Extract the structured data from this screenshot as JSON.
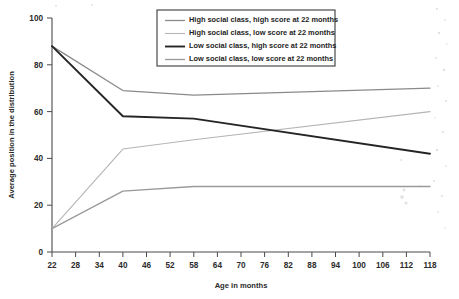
{
  "chart_data": {
    "type": "line",
    "title": "",
    "xlabel": "Age in months",
    "ylabel": "Average position in the distribution",
    "xlim": [
      22,
      118
    ],
    "ylim": [
      0,
      100
    ],
    "xticks": [
      22,
      28,
      34,
      40,
      46,
      52,
      58,
      64,
      70,
      76,
      82,
      88,
      94,
      100,
      106,
      112,
      118
    ],
    "yticks": [
      0,
      20,
      40,
      60,
      80,
      100
    ],
    "grid": false,
    "legend_position": "top-center",
    "x": [
      22,
      40,
      58,
      118
    ],
    "series": [
      {
        "name": "High social class, high score at 22 months",
        "values": [
          88,
          69,
          67,
          70
        ],
        "color": "#8a8a8a",
        "width": 1.3
      },
      {
        "name": "High social class, low score at 22 months",
        "values": [
          10,
          44,
          48,
          60
        ],
        "color": "#b5b5b5",
        "width": 1.1
      },
      {
        "name": "Low social class, high score at 22 months",
        "values": [
          88,
          58,
          57,
          42
        ],
        "color": "#252525",
        "width": 1.9
      },
      {
        "name": "Low social class, low score at 22 months",
        "values": [
          10,
          26,
          28,
          28
        ],
        "color": "#9a9a9a",
        "width": 1.3
      }
    ]
  },
  "axes": {
    "ylabel": "Average position in the distribution",
    "xlabel": "Age in months",
    "ytick_labels": [
      "100",
      "80",
      "60",
      "40",
      "20",
      "0"
    ],
    "xtick_labels": [
      "22",
      "28",
      "34",
      "40",
      "46",
      "52",
      "58",
      "64",
      "70",
      "76",
      "82",
      "88",
      "94",
      "100",
      "106",
      "112",
      "118"
    ]
  },
  "legend": {
    "items": [
      {
        "label": "High social class, high score at 22 months"
      },
      {
        "label": "High social class, low score at 22 months"
      },
      {
        "label": "Low social class, high score at 22 months"
      },
      {
        "label": "Low social class, low score at 22 months"
      }
    ]
  },
  "colors": {
    "axis": "#4a4a4a",
    "text": "#2b2b2b",
    "background": "#ffffff"
  }
}
